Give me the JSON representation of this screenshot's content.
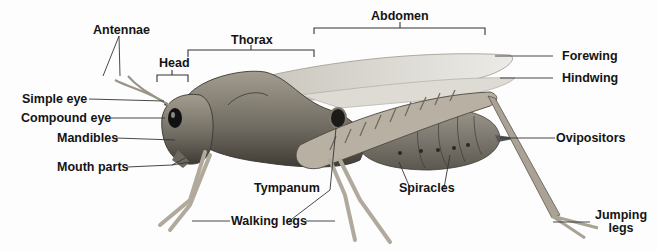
{
  "diagram": {
    "colors": {
      "body": "#8a8478",
      "body_dark": "#4a463f",
      "wing": "#d9d6cf",
      "leg": "#b7b0a2",
      "line": "#333333",
      "text": "#141414"
    },
    "regions": {
      "head": "Head",
      "thorax": "Thorax",
      "abdomen": "Abdomen"
    },
    "labels": {
      "antennae": "Antennae",
      "simple_eye": "Simple eye",
      "compound_eye": "Compound eye",
      "mandibles": "Mandibles",
      "mouth_parts": "Mouth parts",
      "forewing": "Forewing",
      "hindwing": "Hindwing",
      "ovipositors": "Ovipositors",
      "tympanum": "Tympanum",
      "spiracles": "Spiracles",
      "walking_legs": "Walking legs",
      "jumping_legs_1": "Jumping",
      "jumping_legs_2": "legs"
    }
  }
}
